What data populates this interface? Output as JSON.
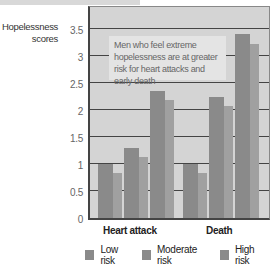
{
  "chart_data": {
    "type": "bar",
    "title": "",
    "xlabel": "",
    "ylabel": "Hopelessness scores",
    "ylim": [
      0,
      3.5
    ],
    "yticks": [
      "3.5",
      "3",
      "2.5",
      "2",
      "1.5",
      "1",
      "0.5",
      "0"
    ],
    "categories": [
      "Heart attack",
      "Death"
    ],
    "series": [
      {
        "name": "Low risk",
        "values": [
          1.0,
          1.0
        ]
      },
      {
        "name": "Moderate risk",
        "values": [
          1.3,
          2.25
        ]
      },
      {
        "name": "High risk",
        "values": [
          2.35,
          3.4
        ]
      }
    ],
    "annotation": "Men who feel extreme hopelessness are at greater risk for heart attacks and early death",
    "grid": true,
    "legend_position": "bottom"
  },
  "axis": {
    "ylabel_line1": "Hopelessness",
    "ylabel_line2": "scores"
  },
  "legend": {
    "items": [
      "Low risk",
      "Moderate risk",
      "High risk"
    ]
  },
  "colors": {
    "plot_bg": "#d4d4d4",
    "bar": "#8a8a8a",
    "bar_shadow": "#a0a0a0",
    "annotation_bg": "#e4e4e4"
  }
}
